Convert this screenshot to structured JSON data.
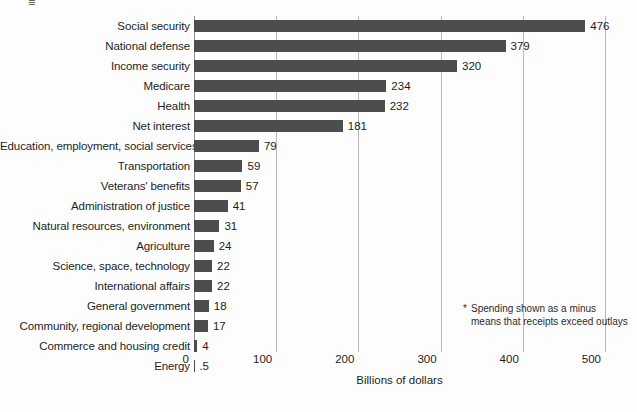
{
  "chart_data": {
    "type": "bar",
    "orientation": "horizontal",
    "title": "",
    "xlabel": "Billions of dollars",
    "ylabel": "",
    "xlim": [
      0,
      500
    ],
    "xticks": [
      "0",
      "100",
      "200",
      "300",
      "400",
      "500"
    ],
    "xtick_values": [
      0,
      100,
      200,
      300,
      400,
      500
    ],
    "grid": "vertical",
    "legend": "none",
    "bar_color": "#4d4d4d",
    "categories": [
      "Social security",
      "National defense",
      "Income security",
      "Medicare",
      "Health",
      "Net interest",
      "Education, employment, social services",
      "Transportation",
      "Veterans' benefits",
      "Administration of justice",
      "Natural resources, environment",
      "Agriculture",
      "Science, space, technology",
      "International affairs",
      "General government",
      "Community, regional development",
      "Commerce and housing credit",
      "Energy"
    ],
    "values": [
      476,
      379,
      320,
      234,
      232,
      181,
      79,
      59,
      57,
      41,
      31,
      24,
      22,
      22,
      18,
      17,
      4,
      0.5
    ],
    "value_labels": [
      "476",
      "379",
      "320",
      "234",
      "232",
      "181",
      "79",
      "59",
      "57",
      "41",
      "31",
      "24",
      "22",
      "22",
      "18",
      "17",
      "4",
      ".5"
    ],
    "annotations": [
      {
        "marker": "*",
        "text": "Spending shown as a minus means that receipts exceed outlays",
        "line1": "Spending shown as a minus",
        "line2": "means that receipts exceed outlays"
      }
    ]
  },
  "artifact": {
    "glyph": "≡"
  }
}
